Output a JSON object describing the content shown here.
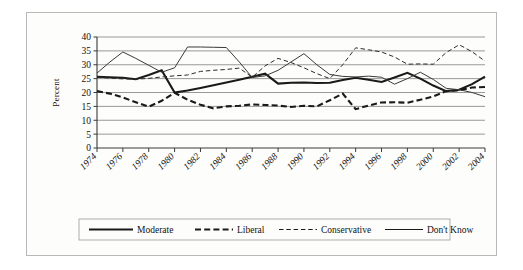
{
  "figure": {
    "ylabel": "Percent",
    "background_color": "#fdfdfb",
    "border_color": "#b8b8b8"
  },
  "chart_data": {
    "type": "line",
    "title": "",
    "xlabel": "",
    "ylabel": "Percent",
    "ylim": [
      0,
      40
    ],
    "ytick_values": [
      0,
      5,
      10,
      15,
      20,
      25,
      30,
      35,
      40
    ],
    "xlim": [
      1974,
      2004
    ],
    "x": [
      1974,
      1975,
      1976,
      1977,
      1978,
      1979,
      1980,
      1981,
      1982,
      1983,
      1984,
      1985,
      1986,
      1987,
      1988,
      1989,
      1990,
      1991,
      1992,
      1993,
      1994,
      1995,
      1996,
      1997,
      1998,
      1999,
      2000,
      2001,
      2002,
      2003,
      2004
    ],
    "xtick_labels": [
      "1974",
      "1976",
      "1978",
      "1980",
      "1982",
      "1984",
      "1986",
      "1988",
      "1990",
      "1992",
      "1994",
      "1996",
      "1998",
      "2000",
      "2002",
      "2004"
    ],
    "xtick_values": [
      1974,
      1976,
      1978,
      1980,
      1982,
      1984,
      1986,
      1988,
      1990,
      1992,
      1994,
      1996,
      1998,
      2000,
      2002,
      2004
    ],
    "grid": true,
    "grid_axis": "y",
    "legend_position": "bottom",
    "series": [
      {
        "name": "Moderate",
        "style": "solid",
        "width": 2.1,
        "color": "#1a1a1a",
        "values": [
          25.7,
          25.5,
          25.3,
          24.8,
          26.3,
          28.0,
          20.0,
          20.7,
          21.6,
          22.6,
          23.6,
          24.6,
          25.7,
          26.8,
          23.2,
          23.5,
          23.6,
          23.4,
          23.5,
          24.5,
          25.3,
          24.6,
          23.8,
          25.4,
          27.1,
          25.0,
          22.5,
          20.5,
          21.0,
          23.0,
          25.7
        ]
      },
      {
        "name": "Liberal",
        "style": "dashed",
        "width": 2.1,
        "color": "#1a1a1a",
        "values": [
          20.5,
          19.6,
          18.2,
          16.5,
          14.9,
          17.0,
          19.9,
          17.4,
          15.6,
          14.3,
          15.0,
          15.2,
          15.7,
          15.5,
          15.3,
          14.8,
          15.2,
          15.0,
          17.2,
          19.6,
          14.0,
          15.3,
          16.4,
          16.5,
          16.3,
          17.4,
          18.6,
          20.5,
          20.8,
          21.8,
          22.0
        ]
      },
      {
        "name": "Conservative",
        "style": "dashed-fine",
        "width": 1.0,
        "color": "#2b2b2b",
        "values": [
          25.4,
          25.2,
          24.9,
          24.8,
          25.1,
          25.6,
          26.0,
          26.3,
          27.6,
          28.0,
          28.3,
          28.8,
          25.5,
          29.6,
          32.3,
          30.8,
          28.9,
          26.8,
          25.0,
          30.0,
          36.1,
          35.4,
          34.6,
          32.8,
          30.2,
          30.3,
          30.2,
          34.4,
          37.2,
          34.7,
          31.3
        ]
      },
      {
        "name": "Don't Know",
        "style": "solid-fine",
        "width": 1.0,
        "color": "#3a3a3a",
        "values": [
          27.0,
          31.0,
          34.6,
          32.3,
          29.8,
          27.3,
          28.9,
          36.4,
          36.4,
          36.3,
          36.2,
          31.0,
          25.4,
          26.0,
          28.0,
          31.0,
          34.0,
          30.0,
          26.5,
          25.8,
          25.6,
          25.9,
          25.5,
          23.0,
          25.0,
          27.3,
          24.7,
          21.5,
          21.0,
          20.0,
          18.5
        ]
      }
    ]
  },
  "legend": {
    "items": [
      {
        "label": "Moderate",
        "style": "solid",
        "width": 2.1
      },
      {
        "label": "Liberal",
        "style": "dashed",
        "width": 2.1
      },
      {
        "label": "Conservative",
        "style": "dashed-fine",
        "width": 1.0
      },
      {
        "label": "Don't Know",
        "style": "solid-fine",
        "width": 1.0
      }
    ]
  }
}
